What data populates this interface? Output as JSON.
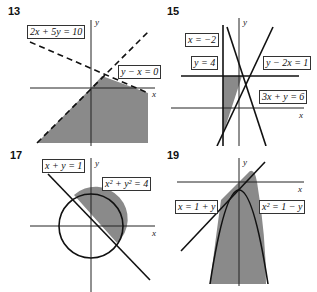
{
  "panels": [
    {
      "number": "13",
      "labels": [
        "2x + 5y = 10",
        "y − x = 0"
      ],
      "axes": {
        "x": "x",
        "y": "y"
      }
    },
    {
      "number": "15",
      "labels": [
        "x = −2",
        "y = 4",
        "y − 2x = 1",
        "3x + y = 6"
      ],
      "axes": {
        "x": "x",
        "y": "y"
      }
    },
    {
      "number": "17",
      "labels": [
        "x + y = 1",
        "x² + y² = 4"
      ],
      "axes": {
        "x": "x",
        "y": "y"
      }
    },
    {
      "number": "19",
      "labels": [
        "x = 1 + y",
        "x² = 1 − y"
      ],
      "axes": {
        "x": "x",
        "y": "y"
      }
    }
  ],
  "colors": {
    "shade": "#8a8a8a",
    "line": "#111111"
  }
}
